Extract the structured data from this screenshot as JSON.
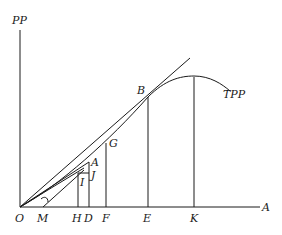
{
  "diagram": {
    "type": "economics-production-curve",
    "y_axis_label": "PP",
    "x_axis_label": "A",
    "curve_label": "TPP",
    "points": {
      "origin": "O",
      "m": "M",
      "h": "H",
      "d": "D",
      "f": "F",
      "e": "E",
      "k": "K",
      "b": "B",
      "g": "G",
      "a": "A",
      "j": "J",
      "i": "I"
    },
    "colors": {
      "ink": "#1a1a1a",
      "background": "#ffffff"
    }
  }
}
